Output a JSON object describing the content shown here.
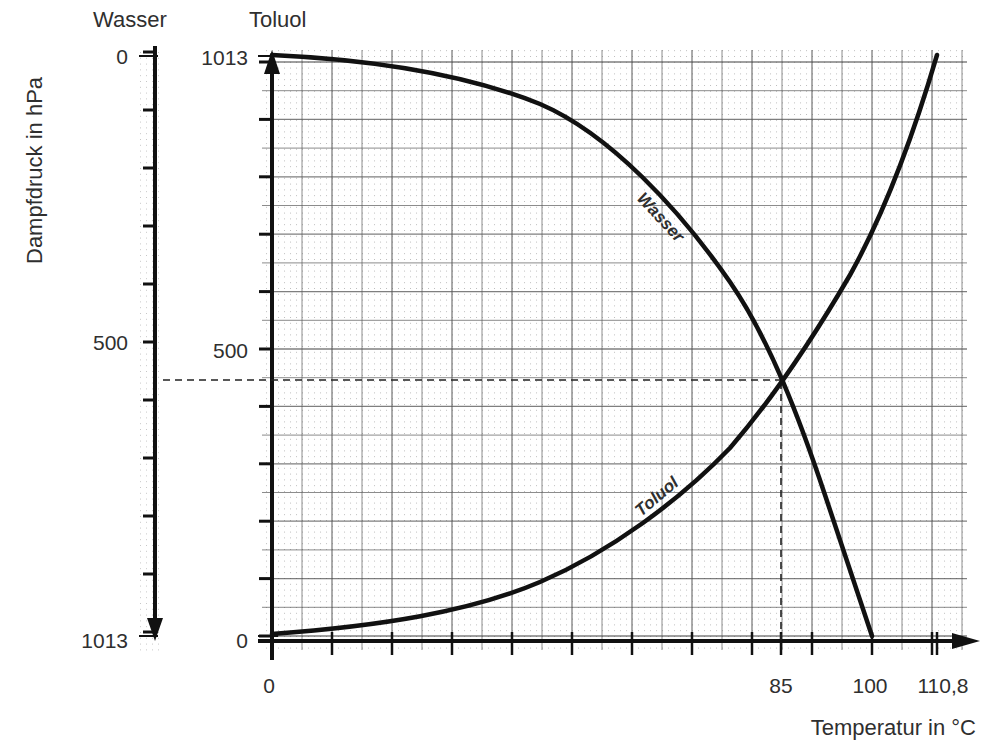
{
  "chart_data": {
    "type": "line",
    "title": "",
    "xlabel": "Temperatur in °C",
    "ylabel": "Dampfdruck in hPa",
    "xlim": [
      0,
      115
    ],
    "x_tick_labels": [
      "0",
      "85",
      "100",
      "110,8"
    ],
    "x_tick_values": [
      0,
      85,
      100,
      110.8
    ],
    "axes": [
      {
        "name": "Wasser",
        "header": "Wasser",
        "direction": "reversed",
        "ylim": [
          0,
          1013
        ],
        "tick_labels": [
          "0",
          "500",
          "1013"
        ]
      },
      {
        "name": "Toluol",
        "header": "Toluol",
        "direction": "normal",
        "ylim": [
          0,
          1013
        ],
        "tick_labels": [
          "1013",
          "500",
          "0"
        ]
      }
    ],
    "grid": true,
    "series": [
      {
        "name": "Wasser",
        "curve_label": "Wasser",
        "axis": "Wasser (reversed, left)",
        "x": [
          0,
          18,
          38,
          50,
          60,
          70,
          80,
          85,
          90,
          95,
          100
        ],
        "y": [
          5,
          31,
          66,
          118,
          205,
          313,
          462,
          569,
          700,
          839,
          1013
        ]
      },
      {
        "name": "Toluol",
        "curve_label": "Toluol",
        "axis": "Toluol (normal)",
        "x": [
          0,
          18,
          30,
          40,
          50,
          60,
          70,
          80,
          85,
          90,
          100,
          106.3,
          110.8
        ],
        "y": [
          3,
          16,
          42,
          77,
          120,
          176,
          258,
          376,
          446,
          516,
          699,
          864,
          1013
        ]
      }
    ],
    "annotations": [
      {
        "type": "dashed-guide",
        "x": 85,
        "toluol_pressure": 446,
        "wasser_pressure": 567,
        "note": "intersection of both curves at 85 °C; sum of partial pressures = 1013 hPa"
      }
    ]
  },
  "labels": {
    "header_wasser": "Wasser",
    "header_toluol": "Toluol",
    "ylabel": "Dampfdruck in hPa",
    "xlabel": "Temperatur in °C",
    "wasser_ticks": {
      "top": "0",
      "mid": "500",
      "bottom": "1013"
    },
    "toluol_ticks": {
      "top": "1013",
      "mid": "500",
      "bottom": "0"
    },
    "x_ticks": {
      "t0": "0",
      "t85": "85",
      "t100": "100",
      "t110": "110,8"
    },
    "curve_wasser": "Wasser",
    "curve_toluol": "Toluol"
  }
}
